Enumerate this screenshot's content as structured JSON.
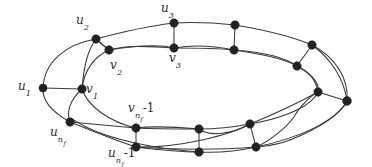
{
  "figure": {
    "name": "prism-like-graph-diagram",
    "background_color": "#ffffff",
    "edge_color": "#3a3a3a",
    "node_color": "#222222",
    "width": 372,
    "height": 167
  },
  "labels": [
    {
      "id": "u1",
      "base": "u",
      "sub": "1",
      "subsub": "",
      "op": "",
      "x": 18,
      "y": 80,
      "full": "u1"
    },
    {
      "id": "u2",
      "base": "u",
      "sub": "2",
      "subsub": "",
      "op": "",
      "x": 76,
      "y": 14,
      "full": "u2"
    },
    {
      "id": "u3",
      "base": "u",
      "sub": "3",
      "subsub": "",
      "op": "",
      "x": 161,
      "y": 2,
      "full": "u3"
    },
    {
      "id": "v1",
      "base": "v",
      "sub": "1",
      "subsub": "",
      "op": "",
      "x": 86,
      "y": 83,
      "full": "v1"
    },
    {
      "id": "v2",
      "base": "v",
      "sub": "2",
      "subsub": "",
      "op": "",
      "x": 110,
      "y": 59,
      "full": "v2"
    },
    {
      "id": "v3",
      "base": "v",
      "sub": "3",
      "subsub": "",
      "op": "",
      "x": 169,
      "y": 52,
      "full": "v3"
    },
    {
      "id": "vnf1",
      "base": "v",
      "sub": "n",
      "subsub": "f",
      "op": "-1",
      "x": 128,
      "y": 102,
      "full": "vnf-1"
    },
    {
      "id": "unf",
      "base": "u",
      "sub": "n",
      "subsub": "f",
      "op": "",
      "x": 50,
      "y": 126,
      "full": "unf"
    },
    {
      "id": "unf1",
      "base": "u",
      "sub": "n",
      "subsub": "f",
      "op": "-1",
      "x": 108,
      "y": 147,
      "full": "unf-1"
    }
  ],
  "nodes": [
    {
      "id": "u1",
      "x": 43,
      "y": 88,
      "r": 4.0,
      "ring": "outer"
    },
    {
      "id": "u2",
      "x": 96,
      "y": 39,
      "r": 4.2,
      "ring": "outer"
    },
    {
      "id": "u3",
      "x": 174,
      "y": 23,
      "r": 4.2,
      "ring": "outer"
    },
    {
      "id": "uA",
      "x": 235,
      "y": 25,
      "r": 4.2,
      "ring": "outer"
    },
    {
      "id": "uB",
      "x": 312,
      "y": 45,
      "r": 4.2,
      "ring": "outer"
    },
    {
      "id": "uC",
      "x": 347,
      "y": 101,
      "r": 4.4,
      "ring": "outer"
    },
    {
      "id": "uD",
      "x": 256,
      "y": 147,
      "r": 4.2,
      "ring": "outer"
    },
    {
      "id": "unf1",
      "x": 199,
      "y": 152,
      "r": 4.2,
      "ring": "outer"
    },
    {
      "id": "unf",
      "x": 70,
      "y": 122,
      "r": 4.2,
      "ring": "outer"
    },
    {
      "id": "v1",
      "x": 82,
      "y": 89,
      "r": 4.2,
      "ring": "inner"
    },
    {
      "id": "v2",
      "x": 109,
      "y": 50,
      "r": 4.2,
      "ring": "inner"
    },
    {
      "id": "v3",
      "x": 174,
      "y": 48,
      "r": 4.2,
      "ring": "inner"
    },
    {
      "id": "vA",
      "x": 234,
      "y": 50,
      "r": 4.2,
      "ring": "inner"
    },
    {
      "id": "vB",
      "x": 297,
      "y": 66,
      "r": 4.2,
      "ring": "inner"
    },
    {
      "id": "vC",
      "x": 318,
      "y": 92,
      "r": 4.2,
      "ring": "inner"
    },
    {
      "id": "vD",
      "x": 250,
      "y": 124,
      "r": 4.2,
      "ring": "inner"
    },
    {
      "id": "vnf1",
      "x": 199,
      "y": 129,
      "r": 4.2,
      "ring": "inner"
    },
    {
      "id": "vnf",
      "x": 136,
      "y": 128,
      "r": 4.2,
      "ring": "inner"
    },
    {
      "id": "vnfb",
      "x": 136,
      "y": 147,
      "r": 4.2,
      "ring": "outer"
    }
  ],
  "edge_paths": [
    "M43,88 C44,62 66,44 96,39",
    "M96,39 C122,32 148,26 174,23",
    "M174,23 C194,22 216,23 235,25",
    "M235,25 C265,30 293,37 312,45",
    "M312,45 C335,57 349,78 347,101",
    "M347,101 C336,121 300,138 256,147",
    "M256,147 C238,151 218,153 199,152",
    "M199,152 C156,149 112,140 86,127",
    "M86,127 C74,121 68,114 70,122",
    "M70,122 C52,112 42,100 43,88",
    "M82,89 C84,70 95,56 109,50",
    "M109,50 C130,44 152,47 174,48",
    "M174,48 C194,48 215,48 234,50",
    "M234,50 C260,54 283,58 297,66",
    "M297,66 C311,74 320,82 318,92",
    "M318,92 C312,106 285,118 250,124",
    "M250,124 C234,127 216,129 199,129",
    "M199,129 C176,129 154,129 136,128",
    "M136,128 C110,122 88,107 82,89",
    "M43,88 L82,89",
    "M96,39 L109,50",
    "M174,23 L174,48",
    "M235,25 L234,50",
    "M312,45 L297,66",
    "M347,101 L318,92",
    "M256,147 L250,124",
    "M199,152 L199,129",
    "M70,122 L136,128",
    "M136,128 L136,147",
    "M136,147 C160,150 180,152 199,152",
    "M136,147 C180,150 220,150 256,147",
    "M136,147 C180,148 230,135 250,124",
    "M70,122 C98,133 120,142 136,147",
    "M82,89 C70,100 66,112 70,122",
    "M109,50 C100,43 97,40 96,39",
    "M82,89 C84,64 88,50 96,39",
    "M174,48 C160,44 135,46 109,50",
    "M234,50 C210,45 190,45 174,48",
    "M297,66 C285,57 260,52 234,50",
    "M318,92 C316,79 308,71 297,66",
    "M250,124 C272,115 298,103 318,92",
    "M199,129 C210,137 232,134 250,124",
    "M136,128 C152,126 176,127 199,129",
    "M347,101 C342,113 320,128 290,140",
    "M290,140 C280,144 268,146 256,147",
    "M312,45 C330,58 344,78 347,101",
    "M256,147 C268,142 290,126 297,112",
    "M297,112 C305,101 312,95 318,92"
  ]
}
